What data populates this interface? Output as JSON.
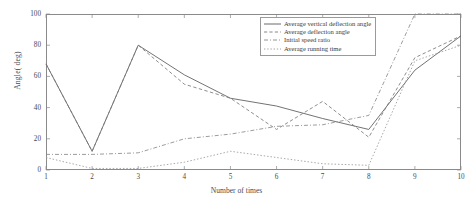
{
  "chart_data": {
    "type": "line",
    "title": "",
    "xlabel": "Number of times",
    "ylabel": "Angle( deg)",
    "xlim": [
      1,
      10
    ],
    "ylim": [
      0,
      100
    ],
    "xticks": [
      "1",
      "2",
      "3",
      "4",
      "5",
      "6",
      "7",
      "8",
      "9",
      "10"
    ],
    "yticks": [
      "0",
      "20",
      "40",
      "60",
      "80",
      "100"
    ],
    "grid": false,
    "legend_position": "upper-right",
    "x": [
      1,
      2,
      3,
      4,
      5,
      6,
      7,
      8,
      9,
      10
    ],
    "series": [
      {
        "name": "Average vertical deflection angle",
        "style": "solid",
        "color": "#5a5a5a",
        "values": [
          68,
          12,
          80,
          61,
          46,
          41,
          33,
          26,
          64,
          86
        ]
      },
      {
        "name": "Average deflection angle",
        "style": "dashed",
        "color": "#7a7a7a",
        "values": [
          68,
          12,
          80,
          55,
          46,
          26,
          44,
          21,
          72,
          86
        ]
      },
      {
        "name": "Initial speed ratio",
        "style": "dash-dot",
        "color": "#8a8a8a",
        "values": [
          10,
          10,
          11,
          20,
          23,
          28,
          29,
          35,
          100,
          100
        ]
      },
      {
        "name": "Average running time",
        "style": "dotted",
        "color": "#9a9a9a",
        "values": [
          8,
          1,
          1,
          5,
          12,
          8,
          4,
          3,
          70,
          80
        ]
      }
    ]
  },
  "legend": {
    "items": [
      {
        "label": "Average vertical deflection angle"
      },
      {
        "label": "Average deflection angle"
      },
      {
        "label": "Initial speed ratio"
      },
      {
        "label": "Average running time"
      }
    ]
  }
}
